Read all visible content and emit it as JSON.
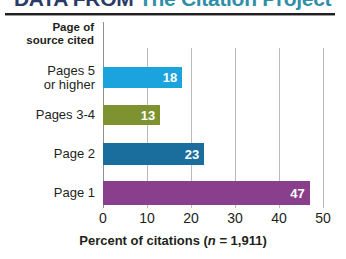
{
  "banner": {
    "title_prefix": "DATA FROM",
    "title_accent": "The Citation Project",
    "full_title": "DATA FROM The Citation Project"
  },
  "chart_data": {
    "type": "bar",
    "orientation": "horizontal",
    "title": "",
    "xlabel_text": "Percent of citations (",
    "xlabel_italic": "n",
    "xlabel_tail": " = 1,911)",
    "xlabel_full": "Percent of citations (n = 1,911)",
    "ylabel": "Page of source cited",
    "ylabel_line1": "Page of",
    "ylabel_line2": "source cited",
    "categories": [
      "Pages 5 or higher",
      "Pages 3-4",
      "Page 2",
      "Page 1"
    ],
    "category_lines": [
      [
        "Pages 5",
        "or higher"
      ],
      [
        "Pages 3-4"
      ],
      [
        "Page 2"
      ],
      [
        "Page 1"
      ]
    ],
    "values": [
      18,
      13,
      23,
      47
    ],
    "value_labels": [
      "18",
      "13",
      "23",
      "47"
    ],
    "colors": [
      "#1ba3dd",
      "#7e922f",
      "#1a6e9e",
      "#8a3f8c"
    ],
    "xlim": [
      0,
      50
    ],
    "xticks": [
      0,
      10,
      20,
      30,
      40,
      50
    ],
    "xtick_labels": [
      "0",
      "10",
      "20",
      "30",
      "40",
      "50"
    ],
    "grid": true,
    "legend": "none",
    "unit": "percent"
  },
  "colors": {
    "grid": "#b9bcbe",
    "axis": "#8e9194",
    "rule": "#231f20",
    "text": "#231f20",
    "value_text": "#ffffff"
  }
}
